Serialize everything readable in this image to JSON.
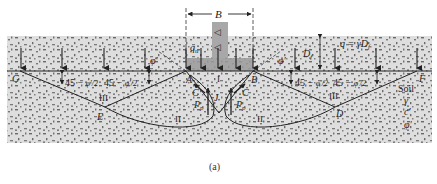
{
  "figure": {
    "caption": "(a)",
    "colors": {
      "soil_bg": "#dedede",
      "speckle": "#6a6a6a",
      "footing": "#9a9a9a",
      "column": "#a8a8a8",
      "line": "#222222"
    },
    "dimension": {
      "label": "B"
    },
    "labels": {
      "qu": "q",
      "qu_sub": "u",
      "df": "D",
      "df_sub": "f",
      "q_eq": "q = γD",
      "q_eq_sub": "f",
      "phi_left": "φ′",
      "phi_right": "φ′",
      "angle_left_1": "45 −",
      "angle_left_1_frac": "φ′/2",
      "angle_left_2": "45 −",
      "angle_left_2_frac": "φ′/2",
      "angle_right_1": "45 −",
      "angle_right_1_frac": "φ′/2",
      "angle_right_2": "45 −",
      "angle_right_2_frac": "φ′/2",
      "I": "I",
      "II_left": "II",
      "II_right": "II",
      "III_left": "III",
      "III_right": "III",
      "pt_G": "G",
      "pt_A": "A",
      "pt_B": "B",
      "pt_F": "F",
      "pt_J": "J",
      "pt_E": "E",
      "pt_D": "D",
      "C_left": "C",
      "C_right": "C",
      "Pp_left": "P",
      "Pp_right": "P",
      "Pp_sub": "p"
    },
    "soil_props": {
      "title": "Soil",
      "gamma": "γ",
      "c": "c′",
      "phi": "φ′"
    }
  }
}
